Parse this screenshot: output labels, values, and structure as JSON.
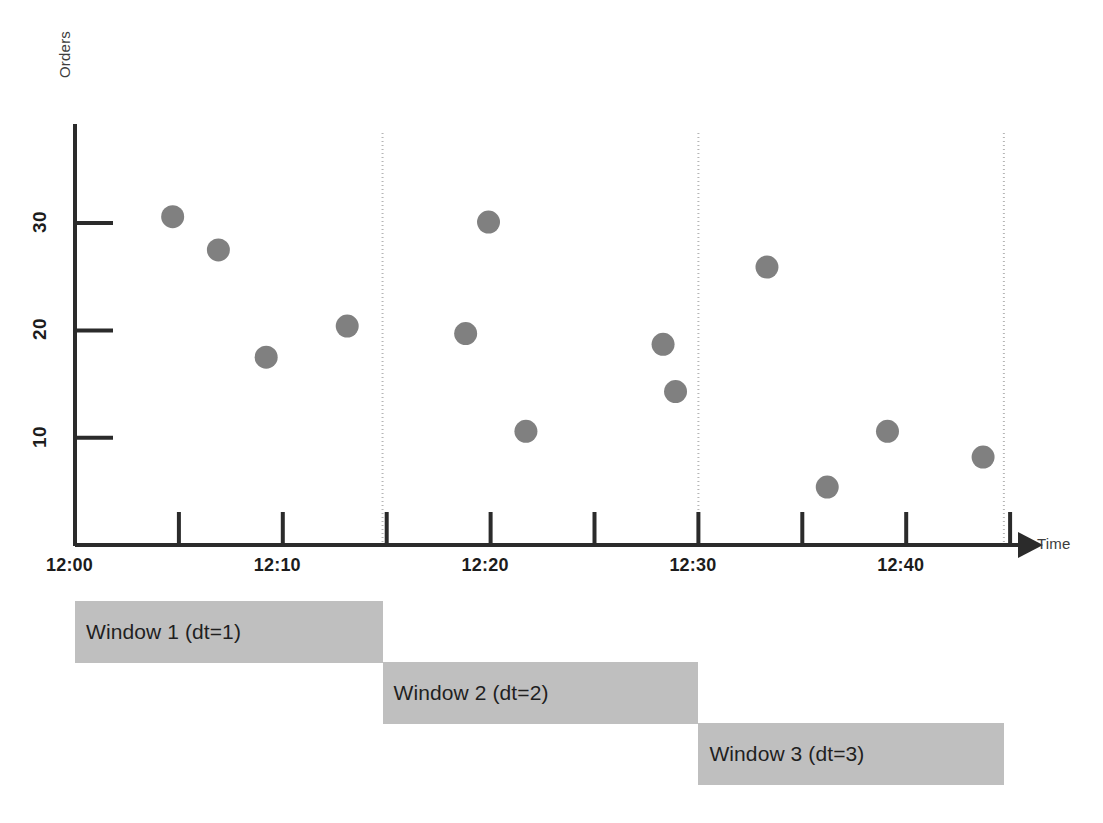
{
  "axes": {
    "y_title": "Orders",
    "x_title": "Time",
    "y_ticks": [
      {
        "label": "10",
        "value": 10
      },
      {
        "label": "20",
        "value": 20
      },
      {
        "label": "30",
        "value": 30
      }
    ],
    "x_ticks": [
      {
        "label": "12:00",
        "minute": 0
      },
      {
        "label": "12:10",
        "minute": 10
      },
      {
        "label": "12:20",
        "minute": 20
      },
      {
        "label": "12:30",
        "minute": 30
      },
      {
        "label": "12:40",
        "minute": 40
      }
    ]
  },
  "windows": [
    {
      "label": "Window 1 (dt=1)",
      "start_minute": 0,
      "end_minute": 14.8,
      "row": 0
    },
    {
      "label": "Window 2 (dt=2)",
      "start_minute": 14.8,
      "end_minute": 30,
      "row": 1
    },
    {
      "label": "Window 3 (dt=3)",
      "start_minute": 30,
      "end_minute": 44.7,
      "row": 2
    }
  ],
  "colors": {
    "point": "#808080",
    "window_bar": "#bfbfbf",
    "axis": "#2b2b2b",
    "divider": "#b5b5b5",
    "text": "#1c1c1c"
  },
  "chart_data": {
    "type": "scatter",
    "title": "",
    "xlabel": "Time",
    "ylabel": "Orders",
    "grid": false,
    "legend": "none",
    "xlim": [
      0,
      47
    ],
    "ylim": [
      0,
      36
    ],
    "x_tick_interval_minutes": 5,
    "x_label_interval_minutes": 10,
    "x_unit": "minutes after 12:00",
    "series": [
      {
        "name": "Orders",
        "marker": "circle",
        "color": "#808080",
        "points": [
          {
            "time": "12:04.7",
            "x": 4.7,
            "y": 30.6
          },
          {
            "time": "12:06.9",
            "x": 6.9,
            "y": 27.5
          },
          {
            "time": "12:09.2",
            "x": 9.2,
            "y": 17.5
          },
          {
            "time": "12:13.1",
            "x": 13.1,
            "y": 20.4
          },
          {
            "time": "12:18.8",
            "x": 18.8,
            "y": 19.7
          },
          {
            "time": "12:19.9",
            "x": 19.9,
            "y": 30.1
          },
          {
            "time": "12:21.7",
            "x": 21.7,
            "y": 10.6
          },
          {
            "time": "12:28.3",
            "x": 28.3,
            "y": 18.7
          },
          {
            "time": "12:28.9",
            "x": 28.9,
            "y": 14.3
          },
          {
            "time": "12:33.3",
            "x": 33.3,
            "y": 25.9
          },
          {
            "time": "12:36.2",
            "x": 36.2,
            "y": 5.4
          },
          {
            "time": "12:39.1",
            "x": 39.1,
            "y": 10.6
          },
          {
            "time": "12:43.7",
            "x": 43.7,
            "y": 8.2
          }
        ]
      }
    ],
    "dividers": [
      {
        "label": "window-1-2-boundary",
        "minute": 14.8
      },
      {
        "label": "window-2-3-boundary",
        "minute": 30
      },
      {
        "label": "window-3-end",
        "minute": 44.7
      }
    ]
  }
}
